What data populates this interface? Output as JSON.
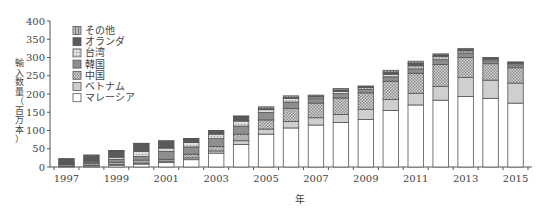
{
  "chart_data": {
    "type": "bar",
    "stacked": true,
    "title": "",
    "xlabel": "年",
    "ylabel": "輸入数量（百万本）",
    "ylim": [
      0,
      400
    ],
    "yticks": [
      0,
      50,
      100,
      150,
      200,
      250,
      300,
      350,
      400
    ],
    "xtick_labels": [
      "1997",
      "1999",
      "2001",
      "2003",
      "2005",
      "2007",
      "2009",
      "2011",
      "2013",
      "2015"
    ],
    "grid": false,
    "legend_position": "upper-left",
    "categories": [
      "1997",
      "1998",
      "1999",
      "2000",
      "2001",
      "2002",
      "2003",
      "2004",
      "2005",
      "2006",
      "2007",
      "2008",
      "2009",
      "2010",
      "2011",
      "2012",
      "2013",
      "2014",
      "2015"
    ],
    "series": [
      {
        "name": "マレーシア",
        "pattern": "white",
        "values": [
          2,
          3,
          5,
          8,
          12,
          20,
          38,
          62,
          90,
          107,
          115,
          122,
          130,
          155,
          170,
          183,
          193,
          188,
          175
        ]
      },
      {
        "name": "ベトナム",
        "pattern": "light-gray",
        "values": [
          1,
          1,
          2,
          3,
          4,
          5,
          6,
          10,
          14,
          18,
          20,
          22,
          28,
          30,
          32,
          38,
          52,
          50,
          55
        ]
      },
      {
        "name": "中国",
        "pattern": "checker",
        "values": [
          4,
          5,
          6,
          8,
          5,
          10,
          12,
          18,
          25,
          35,
          40,
          45,
          45,
          50,
          55,
          60,
          55,
          45,
          42
        ]
      },
      {
        "name": "韓国",
        "pattern": "mid-gray",
        "values": [
          2,
          4,
          8,
          10,
          22,
          20,
          22,
          22,
          20,
          18,
          12,
          12,
          10,
          12,
          12,
          13,
          12,
          8,
          8
        ]
      },
      {
        "name": "台湾",
        "pattern": "dotted",
        "values": [
          2,
          3,
          6,
          14,
          9,
          12,
          12,
          14,
          8,
          10,
          5,
          6,
          5,
          7,
          8,
          8,
          6,
          4,
          4
        ]
      },
      {
        "name": "オランダ",
        "pattern": "dark-gray",
        "values": [
          11,
          16,
          17,
          21,
          19,
          10,
          8,
          12,
          4,
          3,
          2,
          4,
          2,
          6,
          8,
          5,
          4,
          3,
          2
        ]
      },
      {
        "name": "その他",
        "pattern": "striped",
        "values": [
          1,
          1,
          1,
          1,
          1,
          1,
          2,
          2,
          4,
          4,
          3,
          4,
          2,
          5,
          5,
          3,
          3,
          2,
          2
        ]
      }
    ]
  },
  "legend": {
    "items": [
      {
        "label": "その他"
      },
      {
        "label": "オランダ"
      },
      {
        "label": "台湾"
      },
      {
        "label": "韓国"
      },
      {
        "label": "中国"
      },
      {
        "label": "ベトナム"
      },
      {
        "label": "マレーシア"
      }
    ]
  },
  "axes": {
    "y_title_chars": [
      "輸",
      "入",
      "数",
      "量",
      "（",
      "百",
      "万",
      "本",
      "）"
    ],
    "x_title": "年"
  }
}
